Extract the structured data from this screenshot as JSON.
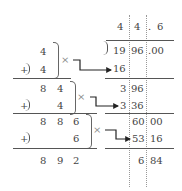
{
  "quotient": {
    "d1": "4",
    "d2": "4",
    "point": ".",
    "d3": "6"
  },
  "radicand": {
    "g1": "19",
    "g2": "96",
    "g3": ".00"
  },
  "right_steps": {
    "r1": "16",
    "r2a": "3",
    "r2b": "96",
    "r3a": "3",
    "r3b": "36",
    "r4a": "60",
    "r4b": "00",
    "r5a": "53",
    "r5b": "16",
    "r6a": "6",
    "r6b": "84"
  },
  "left_steps": {
    "a1": "4",
    "plus1": "+",
    "a2": "4",
    "b1a": "8",
    "b1b": "4",
    "plus2": "+",
    "b2": "4",
    "c1a": "8",
    "c1b": "8",
    "c1c": "6",
    "plus3": "+",
    "c2": "6",
    "d1a": "8",
    "d1b": "9",
    "d1c": "2"
  },
  "times_symbol": "×",
  "colors": {
    "text": "#444444",
    "rule": "#555555",
    "guide": "#999999",
    "arrow": "#222222"
  }
}
